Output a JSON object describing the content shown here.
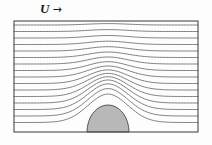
{
  "figure": {
    "background_color": "#fdfdfd"
  },
  "label": {
    "symbol": "U",
    "arrow": "→",
    "meaning": "free-stream velocity direction",
    "position": "above channel, left of center"
  },
  "channel": {
    "name": "channel-box",
    "x": 14,
    "y": 21,
    "width": 184,
    "height": 111,
    "stroke_color": "#4a4a4a",
    "stroke_width": 1.1,
    "fill": "none"
  },
  "bump": {
    "name": "semi-elliptical-obstacle",
    "center_x": 108,
    "base_y": 132,
    "radius_x": 21,
    "radius_y": 27,
    "fill_color": "#b8b8b8",
    "stroke_color": "#555555",
    "stroke_width": 1.0
  },
  "streamlines": {
    "count": 16,
    "stroke_color": "#6b6b6b",
    "stroke_width": 0.85,
    "direction": "left-to-right",
    "inlet_y": [
      25.0,
      31.5,
      38.0,
      44.5,
      51.0,
      57.5,
      64.0,
      70.5,
      77.0,
      83.5,
      90.0,
      96.5,
      103.0,
      109.5,
      116.0,
      122.5
    ],
    "description": "Horizontal streamlines deflected upward over the bump; crowding increases near the crest indicating local flow acceleration."
  },
  "chart_data": {
    "type": "line",
    "xlabel": "",
    "ylabel": "",
    "xlim": [
      14,
      198
    ],
    "ylim": [
      21,
      132
    ],
    "grid": false,
    "legend": "none",
    "annotations": [
      {
        "text": "U",
        "type": "velocity-symbol",
        "x": 44,
        "y": 10
      },
      {
        "text": "→",
        "type": "direction-arrow",
        "x": 58,
        "y": 10
      }
    ],
    "series": [
      {
        "name": "streamline-1",
        "inlet_y": 25.0,
        "deflection": 1.4
      },
      {
        "name": "streamline-2",
        "inlet_y": 31.5,
        "deflection": 1.9
      },
      {
        "name": "streamline-3",
        "inlet_y": 38.0,
        "deflection": 2.5
      },
      {
        "name": "streamline-4",
        "inlet_y": 44.5,
        "deflection": 3.3
      },
      {
        "name": "streamline-5",
        "inlet_y": 51.0,
        "deflection": 4.3
      },
      {
        "name": "streamline-6",
        "inlet_y": 57.5,
        "deflection": 5.5
      },
      {
        "name": "streamline-7",
        "inlet_y": 64.0,
        "deflection": 7.0
      },
      {
        "name": "streamline-8",
        "inlet_y": 70.5,
        "deflection": 8.8
      },
      {
        "name": "streamline-9",
        "inlet_y": 77.0,
        "deflection": 11.0
      },
      {
        "name": "streamline-10",
        "inlet_y": 83.5,
        "deflection": 13.6
      },
      {
        "name": "streamline-11",
        "inlet_y": 90.0,
        "deflection": 16.6
      },
      {
        "name": "streamline-12",
        "inlet_y": 96.5,
        "deflection": 19.8
      },
      {
        "name": "streamline-13",
        "inlet_y": 103.0,
        "deflection": 23.0
      },
      {
        "name": "streamline-14",
        "inlet_y": 109.5,
        "deflection": 25.6
      },
      {
        "name": "streamline-15",
        "inlet_y": 116.0,
        "deflection": 27.4
      },
      {
        "name": "streamline-16",
        "inlet_y": 122.5,
        "deflection": 28.4
      }
    ]
  }
}
